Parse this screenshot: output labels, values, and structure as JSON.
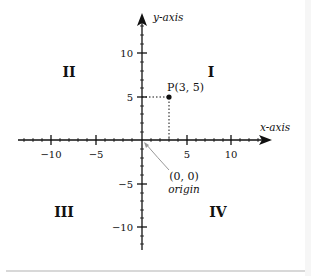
{
  "diagram": {
    "axes": {
      "x_label": "x-axis",
      "y_label": "y-axis",
      "x_ticks": [
        "−10",
        "−5",
        "5",
        "10"
      ],
      "y_ticks": [
        "10",
        "5",
        "−5",
        "−10"
      ]
    },
    "quadrants": {
      "q1": "I",
      "q2": "II",
      "q3": "III",
      "q4": "IV"
    },
    "point": {
      "label": "P(3, 5)",
      "x": 3,
      "y": 5
    },
    "origin": {
      "coords": "(0, 0)",
      "label": "origin"
    },
    "colors": {
      "axis": "#111111",
      "leader_line": "#999999",
      "background": "#ffffff"
    }
  }
}
